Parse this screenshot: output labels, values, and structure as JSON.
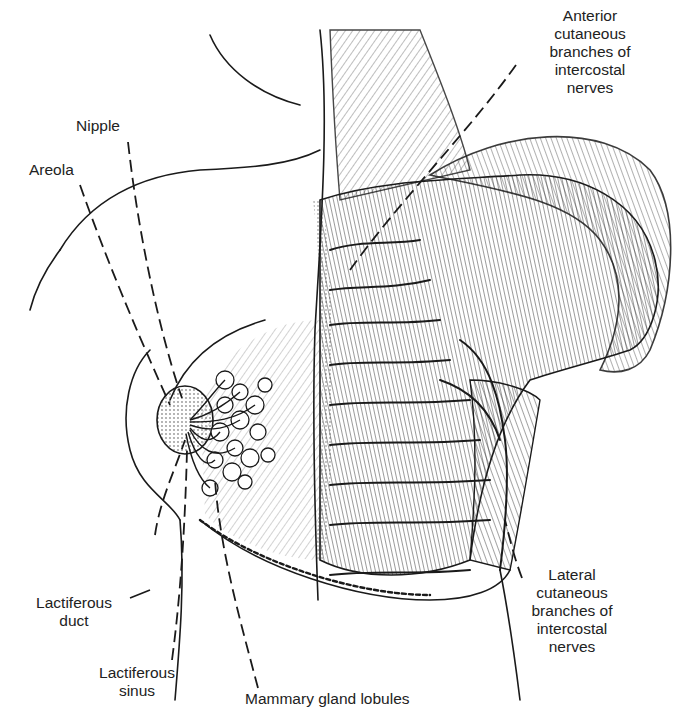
{
  "figure": {
    "style": "black-and-white pen illustration"
  },
  "labels": {
    "anterior": {
      "lines": [
        "Anterior",
        "cutaneous",
        "branches of",
        "intercostal",
        "nerves"
      ]
    },
    "nipple": {
      "lines": [
        "Nipple"
      ]
    },
    "areola": {
      "lines": [
        "Areola"
      ]
    },
    "lactiferous_duct": {
      "lines": [
        "Lactiferous",
        "duct"
      ]
    },
    "lactiferous_sinus": {
      "lines": [
        "Lactiferous",
        "sinus"
      ]
    },
    "mammary_lobules": {
      "lines": [
        "Mammary gland lobules"
      ]
    },
    "lateral": {
      "lines": [
        "Lateral",
        "cutaneous",
        "branches of",
        "intercostal",
        "nerves"
      ]
    }
  },
  "colors": {
    "ink": "#1a1a1a",
    "background": "#ffffff"
  }
}
